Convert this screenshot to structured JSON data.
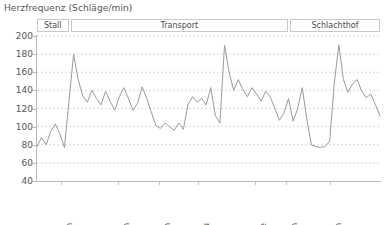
{
  "chart_data": {
    "type": "line",
    "title": "Herzfrequenz (Schläge/min)",
    "xlabel": "",
    "ylabel": "",
    "ylim": [
      40,
      200
    ],
    "yticks": [
      200,
      180,
      160,
      140,
      120,
      100,
      80,
      60,
      40
    ],
    "grid": true,
    "legend": "none",
    "line_color": "#9a9a9a",
    "grid_color": "#d8d8d8",
    "axis_color": "#b9b9b9",
    "phases": [
      {
        "label": "Stall",
        "start_pct": 0.0,
        "end_pct": 9.2
      },
      {
        "label": "Transport",
        "start_pct": 9.8,
        "end_pct": 73.2
      },
      {
        "label": "Schlachthof",
        "start_pct": 73.8,
        "end_pct": 100.0
      }
    ],
    "xtick_labels": [
      {
        "label": "Beladen",
        "pos_pct": 7.0
      },
      {
        "label": "Anhalten",
        "pos_pct": 23.5
      },
      {
        "label": "kurvenreich",
        "pos_pct": 35.6
      },
      {
        "label": "Stau",
        "pos_pct": 46.9
      },
      {
        "label": "Fahrtende",
        "pos_pct": 63.6
      },
      {
        "label": "Entladen",
        "pos_pct": 72.6
      },
      {
        "label": "Kämpfen",
        "pos_pct": 85.4
      }
    ],
    "values": [
      78,
      88,
      80,
      95,
      103,
      92,
      77,
      128,
      180,
      152,
      134,
      127,
      140,
      131,
      124,
      139,
      128,
      118,
      133,
      143,
      131,
      118,
      126,
      144,
      131,
      116,
      101,
      98,
      104,
      100,
      96,
      104,
      97,
      124,
      133,
      127,
      131,
      124,
      143,
      112,
      104,
      190,
      160,
      140,
      152,
      141,
      133,
      143,
      136,
      128,
      139,
      133,
      120,
      107,
      115,
      131,
      106,
      120,
      143,
      108,
      80,
      78,
      77,
      78,
      84,
      148,
      190,
      152,
      138,
      147,
      152,
      139,
      132,
      136,
      124,
      112
    ],
    "n_points": 76
  }
}
